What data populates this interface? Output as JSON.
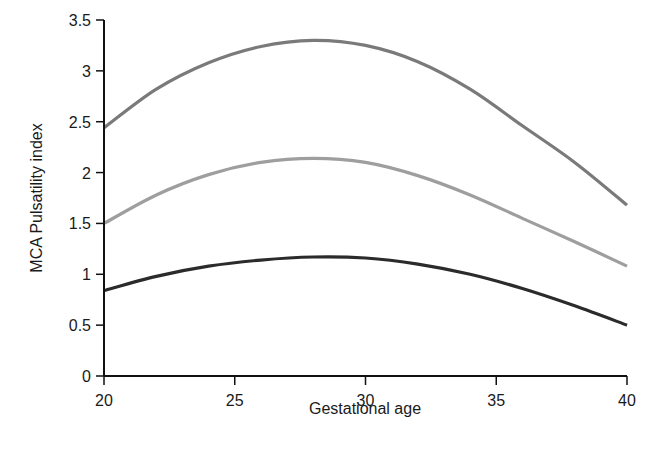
{
  "chart_data": {
    "type": "line",
    "title": "",
    "xlabel": "Gestational age",
    "ylabel": "MCA Pulsatility index",
    "xlim": [
      20,
      40
    ],
    "ylim": [
      0,
      3.5
    ],
    "grid": false,
    "legend": null,
    "x_ticks": [
      "20",
      "25",
      "30",
      "35",
      "40"
    ],
    "y_ticks": [
      "0",
      "0.5",
      "1",
      "1.5",
      "2",
      "2.5",
      "3",
      "3.5"
    ],
    "x": [
      20,
      22,
      24,
      26,
      28,
      30,
      32,
      34,
      36,
      38,
      40
    ],
    "series": [
      {
        "name": "upper",
        "color": "#7a7a7a",
        "values": [
          2.44,
          2.82,
          3.08,
          3.24,
          3.3,
          3.25,
          3.09,
          2.82,
          2.46,
          2.1,
          1.68
        ]
      },
      {
        "name": "middle",
        "color": "#9e9e9e",
        "values": [
          1.5,
          1.78,
          1.98,
          2.1,
          2.14,
          2.1,
          1.97,
          1.78,
          1.55,
          1.32,
          1.08
        ]
      },
      {
        "name": "lower",
        "color": "#2b2b2b",
        "values": [
          0.84,
          0.98,
          1.08,
          1.14,
          1.17,
          1.16,
          1.1,
          1.0,
          0.86,
          0.69,
          0.5
        ]
      }
    ]
  }
}
